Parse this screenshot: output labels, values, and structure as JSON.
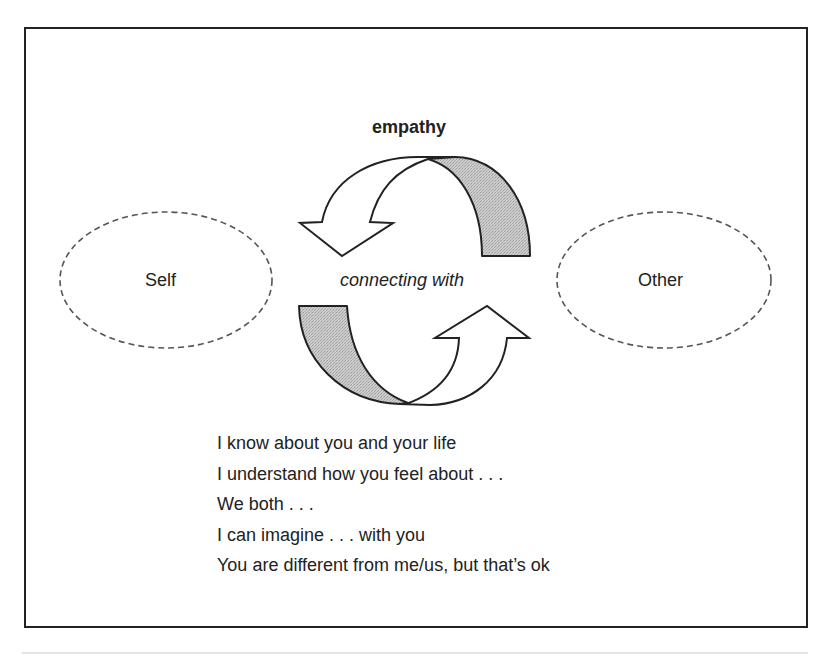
{
  "diagram": {
    "title": "empathy",
    "center_label": "connecting with",
    "left_node": {
      "label": "Self"
    },
    "right_node": {
      "label": "Other"
    },
    "statements": [
      "I know about you and your life",
      "I understand how you feel about . . .",
      "We both . . .",
      "I can imagine . . . with you",
      "You are different from me/us, but that’s ok"
    ],
    "colors": {
      "stroke": "#222222",
      "band_fill": "#c4c4c4",
      "arrow_fill": "#ffffff",
      "ellipse_stroke": "#555555"
    },
    "icons": {
      "top_arrow": "curved-arrow-left-down-icon",
      "bottom_arrow": "curved-arrow-right-up-icon"
    }
  }
}
